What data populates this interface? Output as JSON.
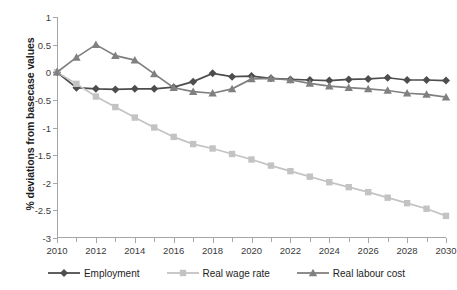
{
  "chart_data": {
    "type": "line",
    "title": "",
    "xlabel": "",
    "ylabel": "% deviations from basecase values",
    "xlim": [
      2010,
      2030
    ],
    "ylim": [
      -3,
      1
    ],
    "ytick_step": 0.5,
    "grid": false,
    "legend_position": "bottom",
    "yticks": [
      "1",
      "0.5",
      "0",
      "-0.5",
      "-1",
      "-1.5",
      "-2",
      "-2.5",
      "-3"
    ],
    "ytick_values": [
      1,
      0.5,
      0,
      -0.5,
      -1,
      -1.5,
      -2,
      -2.5,
      -3
    ],
    "xticks": [
      "2010",
      "2012",
      "2014",
      "2016",
      "2018",
      "2020",
      "2022",
      "2024",
      "2026",
      "2028",
      "2030"
    ],
    "xtick_values": [
      2010,
      2012,
      2014,
      2016,
      2018,
      2020,
      2022,
      2024,
      2026,
      2028,
      2030
    ],
    "x": [
      2010,
      2011,
      2012,
      2013,
      2014,
      2015,
      2016,
      2017,
      2018,
      2019,
      2020,
      2021,
      2022,
      2023,
      2024,
      2025,
      2026,
      2027,
      2028,
      2029,
      2030
    ],
    "series": [
      {
        "name": "Employment",
        "marker": "diamond",
        "color": "#4d4d4d",
        "values": [
          0.0,
          -0.28,
          -0.3,
          -0.31,
          -0.3,
          -0.3,
          -0.27,
          -0.17,
          -0.02,
          -0.08,
          -0.07,
          -0.11,
          -0.13,
          -0.14,
          -0.15,
          -0.13,
          -0.12,
          -0.1,
          -0.14,
          -0.14,
          -0.15
        ]
      },
      {
        "name": "Real wage rate",
        "marker": "square",
        "color": "#c3c3c3",
        "values": [
          0.0,
          -0.21,
          -0.44,
          -0.63,
          -0.82,
          -1.0,
          -1.17,
          -1.3,
          -1.38,
          -1.48,
          -1.58,
          -1.69,
          -1.79,
          -1.89,
          -1.99,
          -2.08,
          -2.17,
          -2.27,
          -2.37,
          -2.47,
          -2.6
        ]
      },
      {
        "name": "Real labour cost",
        "marker": "triangle",
        "color": "#808080",
        "values": [
          0.0,
          0.27,
          0.5,
          0.3,
          0.22,
          -0.03,
          -0.28,
          -0.35,
          -0.38,
          -0.3,
          -0.12,
          -0.11,
          -0.14,
          -0.2,
          -0.25,
          -0.28,
          -0.3,
          -0.33,
          -0.38,
          -0.4,
          -0.45
        ]
      }
    ]
  },
  "legend": {
    "items": [
      {
        "label": "Employment",
        "key": "employment"
      },
      {
        "label": "Real wage rate",
        "key": "real-wage-rate"
      },
      {
        "label": "Real labour cost",
        "key": "real-labour-cost"
      }
    ]
  }
}
